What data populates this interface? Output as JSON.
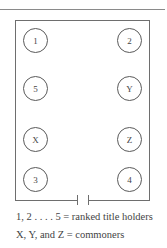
{
  "diagram": {
    "seats_left": [
      "1",
      "5",
      "X",
      "3"
    ],
    "seats_right": [
      "2",
      "Y",
      "Z",
      "4"
    ]
  },
  "legend": {
    "line1": "1, 2 . . . . 5 = ranked title holders",
    "line2": "X, Y, and Z = commoners"
  }
}
